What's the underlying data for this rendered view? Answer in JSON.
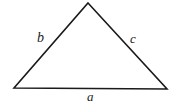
{
  "figure": {
    "name": "labeled-triangle",
    "background_color": "#ffffff",
    "stroke_color": "#1a1a1a",
    "stroke_width": 1.6,
    "width": 177,
    "height": 104,
    "vertices": {
      "apex": {
        "x": 88,
        "y": 3
      },
      "bottom_left": {
        "x": 14,
        "y": 88
      },
      "bottom_right": {
        "x": 167,
        "y": 89
      }
    },
    "labels": {
      "side_a": "a",
      "side_b": "b",
      "side_c": "c"
    },
    "label_positions": {
      "side_a": {
        "x": 88,
        "y": 96
      },
      "side_b": {
        "x": 42,
        "y": 38
      },
      "side_c": {
        "x": 134,
        "y": 39
      }
    }
  }
}
